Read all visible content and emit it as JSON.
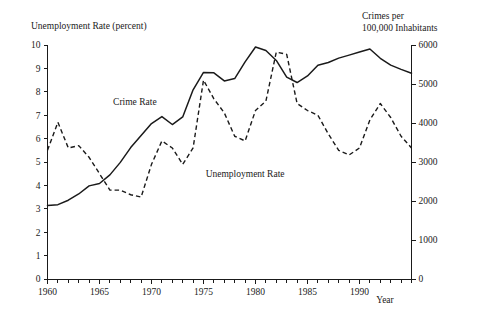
{
  "chart_data": {
    "type": "line",
    "title": "",
    "xlabel": "Year",
    "left_axis_title": "Unemployment Rate (percent)",
    "right_axis_title_line1": "Crimes per",
    "right_axis_title_line2": "100,000 Inhabitants",
    "grid": false,
    "legend_position": "inline-annotations",
    "xlim": [
      1960,
      1995
    ],
    "xticks": [
      1960,
      1965,
      1970,
      1975,
      1980,
      1985,
      1990
    ],
    "xtick_labels": [
      "1960",
      "1965",
      "1970",
      "1975",
      "1980",
      "1985",
      "1990"
    ],
    "xtick_minor_step": 1,
    "left_ylim": [
      0,
      10
    ],
    "left_yticks": [
      0,
      1,
      2,
      3,
      4,
      5,
      6,
      7,
      8,
      9,
      10
    ],
    "left_ytick_labels": [
      "0",
      "1",
      "2",
      "3",
      "4",
      "5",
      "6",
      "7",
      "8",
      "9",
      "10"
    ],
    "right_ylim": [
      0,
      6000
    ],
    "right_yticks": [
      0,
      1000,
      2000,
      3000,
      4000,
      5000,
      6000
    ],
    "right_ytick_labels": [
      "0",
      "1000",
      "2000",
      "3000",
      "4000",
      "5000",
      "6000"
    ],
    "x": [
      1960,
      1961,
      1962,
      1963,
      1964,
      1965,
      1966,
      1967,
      1968,
      1969,
      1970,
      1971,
      1972,
      1973,
      1974,
      1975,
      1976,
      1977,
      1978,
      1979,
      1980,
      1981,
      1982,
      1983,
      1984,
      1985,
      1986,
      1987,
      1988,
      1989,
      1990,
      1991,
      1992,
      1993,
      1994,
      1995
    ],
    "series": [
      {
        "name": "Unemployment Rate",
        "axis": "left",
        "style": "dashed",
        "units": "percent",
        "label_x": 1979.0,
        "label_y": 4.35,
        "values": [
          5.5,
          6.7,
          5.6,
          5.7,
          5.2,
          4.5,
          3.8,
          3.8,
          3.6,
          3.5,
          4.9,
          5.9,
          5.6,
          4.9,
          5.6,
          8.5,
          7.7,
          7.1,
          6.1,
          5.9,
          7.2,
          7.6,
          9.7,
          9.6,
          7.5,
          7.2,
          7.0,
          6.2,
          5.5,
          5.3,
          5.6,
          6.8,
          7.5,
          6.9,
          6.1,
          5.6
        ]
      },
      {
        "name": "Crime Rate",
        "axis": "right",
        "style": "solid",
        "units": "crimes per 100,000 inhabitants",
        "label_x": 1968.4,
        "label_y_right": 4450,
        "values": [
          1887,
          1906,
          2020,
          2180,
          2388,
          2449,
          2670,
          2990,
          3370,
          3680,
          3985,
          4165,
          3961,
          4155,
          4850,
          5298,
          5287,
          5078,
          5140,
          5566,
          5950,
          5858,
          5604,
          5175,
          5038,
          5207,
          5480,
          5550,
          5664,
          5741,
          5820,
          5898,
          5660,
          5485,
          5374,
          5275
        ]
      }
    ],
    "annotations": [
      {
        "text": "Crime Rate",
        "x": 1968.4,
        "y_right": 4450
      },
      {
        "text": "Unemployment Rate",
        "x": 1979.0,
        "y_left": 4.35
      }
    ],
    "colors": {
      "line": "#1a1a1a",
      "background": "#ffffff",
      "axis": "#1a1a1a"
    }
  }
}
